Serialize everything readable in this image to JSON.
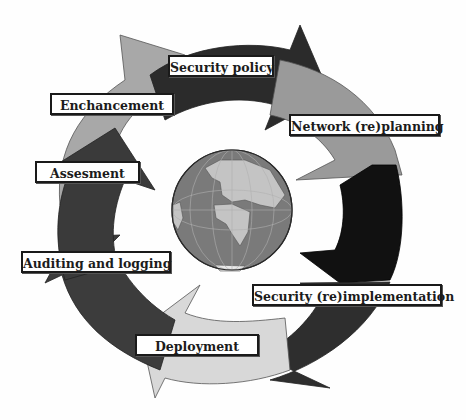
{
  "diagram": {
    "type": "cycle",
    "center_icon": "globe-icon",
    "steps": [
      {
        "id": "security-policy",
        "label": "Security policy",
        "arrow_color": "#2b2b2b"
      },
      {
        "id": "network-replanning",
        "label": "Network (re)planning",
        "arrow_color": "#9a9a9a"
      },
      {
        "id": "security-reimplementation",
        "label": "Security (re)implementation",
        "arrow_color": "#111111"
      },
      {
        "id": "deployment",
        "label": "Deployment",
        "arrow_color": "#d8d8d8"
      },
      {
        "id": "auditing-logging",
        "label": "Auditing and logging",
        "arrow_color": "#3c3c3c"
      },
      {
        "id": "assesment",
        "label": "Assesment",
        "arrow_color": "#3a3a3a"
      },
      {
        "id": "enchancement",
        "label": "Enchancement",
        "arrow_color": "#a8a8a8"
      }
    ],
    "colors": {
      "globe_ocean": "#7a7a7a",
      "globe_land": "#c4c4c4",
      "globe_grid": "#b0b0b0",
      "label_border": "#1a1a1a",
      "background": "#fefefe"
    }
  }
}
